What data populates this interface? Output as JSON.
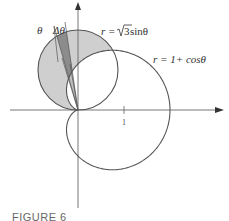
{
  "figure": {
    "caption": "FIGURE 6",
    "curves": [
      {
        "name": "circle",
        "equation_prefix": "r = ",
        "equation_sqrt": "3",
        "equation_suffix": " sinθ"
      },
      {
        "name": "cardioid",
        "equation": "r = 1+ cosθ"
      }
    ],
    "angle_labels": {
      "theta": "θ",
      "delta_theta": "Δθ"
    },
    "x_axis_tick": "1",
    "colors": {
      "curve_stroke": "#555555",
      "region_fill": "#cfcfcf",
      "wedge_fill": "#8c8c8c",
      "axis": "#666666"
    }
  }
}
